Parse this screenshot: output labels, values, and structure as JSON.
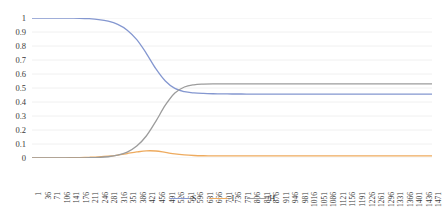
{
  "chart_data": {
    "type": "line",
    "title": "",
    "subtitle": "",
    "xlabel": "",
    "ylabel": "",
    "xlim": [
      1,
      1471
    ],
    "ylim": [
      0,
      1
    ],
    "grid": true,
    "grid_axis": "y",
    "legend_position": "bottom",
    "y_ticks": [
      "0",
      "0.1",
      "0.2",
      "0.3",
      "0.4",
      "0.5",
      "0.6",
      "0.7",
      "0.8",
      "0.9",
      "1"
    ],
    "y_tick_values": [
      0,
      0.1,
      0.2,
      0.3,
      0.4,
      0.5,
      0.6,
      0.7,
      0.8,
      0.9,
      1
    ],
    "x_tick_labels": [
      "1",
      "36",
      "71",
      "106",
      "141",
      "176",
      "211",
      "246",
      "281",
      "316",
      "351",
      "386",
      "421",
      "456",
      "491",
      "526",
      "561",
      "596",
      "631",
      "666",
      "701",
      "736",
      "771",
      "806",
      "841",
      "876",
      "911",
      "946",
      "981",
      "1016",
      "1051",
      "1086",
      "1121",
      "1156",
      "1191",
      "1226",
      "1261",
      "1296",
      "1331",
      "1366",
      "1401",
      "1436",
      "1471"
    ],
    "x_tick_values": [
      1,
      36,
      71,
      106,
      141,
      176,
      211,
      246,
      281,
      316,
      351,
      386,
      421,
      456,
      491,
      526,
      561,
      596,
      631,
      666,
      701,
      736,
      771,
      806,
      841,
      876,
      911,
      946,
      981,
      1016,
      1051,
      1086,
      1121,
      1156,
      1191,
      1226,
      1261,
      1296,
      1331,
      1366,
      1401,
      1436,
      1471
    ],
    "x": [
      1,
      36,
      71,
      106,
      141,
      176,
      211,
      246,
      281,
      316,
      351,
      386,
      421,
      456,
      491,
      526,
      561,
      596,
      631,
      666,
      701,
      736,
      771,
      806,
      841,
      876,
      911,
      946,
      981,
      1016,
      1051,
      1086,
      1121,
      1156,
      1191,
      1226,
      1261,
      1296,
      1331,
      1366,
      1401,
      1436,
      1471
    ],
    "series": [
      {
        "name": "S",
        "color": "#8497d0",
        "values": [
          1.0,
          1.0,
          1.0,
          1.0,
          0.999,
          0.998,
          0.995,
          0.989,
          0.977,
          0.954,
          0.913,
          0.845,
          0.748,
          0.638,
          0.55,
          0.497,
          0.474,
          0.465,
          0.461,
          0.459,
          0.458,
          0.457,
          0.457,
          0.456,
          0.456,
          0.456,
          0.456,
          0.456,
          0.456,
          0.456,
          0.456,
          0.456,
          0.456,
          0.456,
          0.456,
          0.456,
          0.456,
          0.456,
          0.456,
          0.456,
          0.456,
          0.456,
          0.456
        ]
      },
      {
        "name": "I",
        "color": "#eeab5f",
        "values": [
          0.0,
          0.001,
          0.001,
          0.001,
          0.002,
          0.003,
          0.005,
          0.008,
          0.013,
          0.021,
          0.032,
          0.043,
          0.051,
          0.05,
          0.04,
          0.029,
          0.022,
          0.018,
          0.016,
          0.015,
          0.015,
          0.015,
          0.015,
          0.015,
          0.015,
          0.015,
          0.015,
          0.015,
          0.015,
          0.015,
          0.015,
          0.015,
          0.015,
          0.015,
          0.015,
          0.015,
          0.015,
          0.015,
          0.015,
          0.015,
          0.015,
          0.015,
          0.015
        ]
      },
      {
        "name": "H",
        "color": "#9c9c9c",
        "values": [
          0.0,
          0.0,
          0.0,
          0.0,
          0.0,
          0.001,
          0.002,
          0.004,
          0.009,
          0.02,
          0.042,
          0.085,
          0.157,
          0.262,
          0.377,
          0.464,
          0.507,
          0.523,
          0.528,
          0.53,
          0.53,
          0.53,
          0.53,
          0.53,
          0.53,
          0.53,
          0.53,
          0.53,
          0.53,
          0.53,
          0.53,
          0.53,
          0.53,
          0.53,
          0.53,
          0.53,
          0.53,
          0.53,
          0.53,
          0.53,
          0.53,
          0.53,
          0.53
        ]
      }
    ],
    "legend": [
      {
        "label": "S",
        "color": "#8497d0"
      },
      {
        "label": "I",
        "color": "#eeab5f"
      },
      {
        "label": "H",
        "color": "#9c9c9c"
      }
    ],
    "gridline_color": "#f0f0f0",
    "background_color": "#ffffff"
  }
}
